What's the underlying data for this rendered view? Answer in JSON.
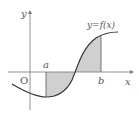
{
  "diagram": {
    "title": "",
    "labels": {
      "y_axis": "y",
      "x_axis": "x",
      "origin": "O",
      "a": "a",
      "b": "b",
      "curve": "y=f(x)"
    },
    "colors": {
      "axis": "#777777",
      "curve": "#333333",
      "shade": "#d0d0d0",
      "text": "#555555"
    }
  }
}
